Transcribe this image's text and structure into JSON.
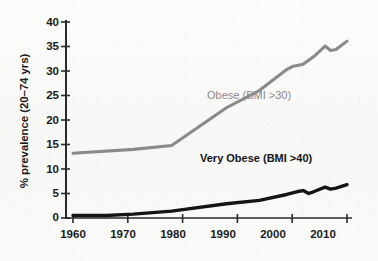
{
  "chart_data": {
    "type": "line",
    "title": "",
    "xlabel": "",
    "ylabel": "% prevalence (20–74 yrs)",
    "xlim": [
      1960,
      2010
    ],
    "ylim": [
      0,
      40
    ],
    "grid": false,
    "legend_position": "inline-annotation",
    "x_ticks": [
      "1960",
      "1970",
      "1980",
      "1990",
      "2000",
      "2010"
    ],
    "y_ticks": [
      "0",
      "5",
      "10",
      "15",
      "20",
      "25",
      "30",
      "35",
      "40"
    ],
    "series": [
      {
        "name": "Obese (BMI >30)",
        "color": "#8a8a8a",
        "x": [
          1960,
          1971,
          1978,
          1988,
          1994,
          1999,
          2000,
          2002,
          2004,
          2006,
          2007,
          2008,
          2010
        ],
        "values": [
          13.2,
          14.0,
          14.8,
          22.5,
          26.0,
          30.3,
          30.9,
          31.4,
          33.0,
          35.1,
          34.2,
          34.4,
          36.1
        ]
      },
      {
        "name": "Very Obese (BMI >40)",
        "color": "#151515",
        "x": [
          1960,
          1966,
          1971,
          1978,
          1988,
          1994,
          1999,
          2001,
          2002,
          2003,
          2004,
          2006,
          2007,
          2008,
          2010
        ],
        "values": [
          0.5,
          0.5,
          0.8,
          1.4,
          2.9,
          3.6,
          4.8,
          5.4,
          5.6,
          5.0,
          5.4,
          6.3,
          5.9,
          6.1,
          6.8
        ]
      }
    ]
  },
  "axes": {
    "y_title": "% prevalence (20–74 yrs)",
    "y_tick_labels": [
      "40",
      "35",
      "30",
      "25",
      "20",
      "15",
      "10",
      "5",
      "0"
    ],
    "x_tick_labels": [
      "1960",
      "1970",
      "1980",
      "1990",
      "2000",
      "2010"
    ]
  },
  "annotations": {
    "obese_label": "Obese (BMI >30)",
    "very_obese_label": "Very Obese (BMI >40)"
  },
  "colors": {
    "obese_line": "#8a8a8a",
    "very_obese_line": "#151515",
    "axis": "#2a2a2a",
    "background": "#fbfbfa"
  }
}
